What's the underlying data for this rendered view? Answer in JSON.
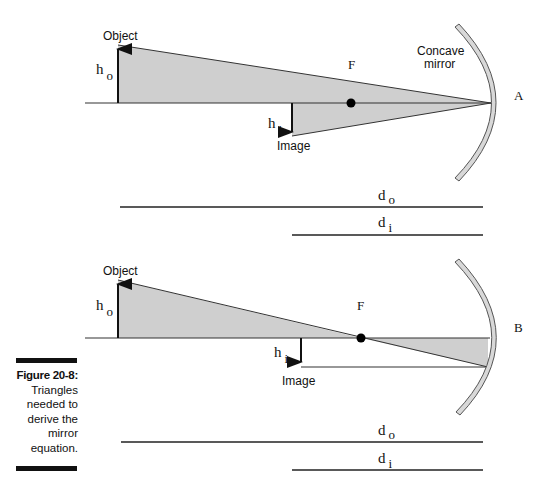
{
  "figure": {
    "number_label": "Figure 20-8:",
    "caption": "Triangles needed to derive the mirror equation."
  },
  "diagram_a": {
    "panel_label": "A",
    "object_label": "Object",
    "image_label": "Image",
    "focal_label": "F",
    "mirror_label_line1": "Concave",
    "mirror_label_line2": "mirror",
    "h_object": {
      "base": "h",
      "sub": "o"
    },
    "h_image": {
      "base": "h",
      "sub": "i"
    },
    "d_object": {
      "base": "d",
      "sub": "o"
    },
    "d_image": {
      "base": "d",
      "sub": "i"
    }
  },
  "diagram_b": {
    "panel_label": "B",
    "object_label": "Object",
    "image_label": "Image",
    "focal_label": "F",
    "h_object": {
      "base": "h",
      "sub": "o"
    },
    "h_image": {
      "base": "h",
      "sub": "i"
    },
    "d_object": {
      "base": "d",
      "sub": "o"
    },
    "d_image": {
      "base": "d",
      "sub": "i"
    }
  },
  "colors": {
    "triangle_fill": "#cfcfcf",
    "mirror_fill": "#d8d8d8",
    "line": "#222222"
  }
}
